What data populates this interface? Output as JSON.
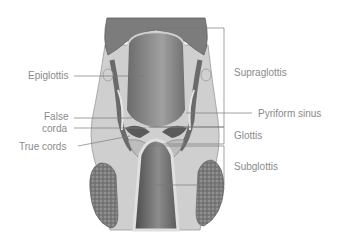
{
  "diagram": {
    "left_labels": [
      {
        "id": "epiglottis",
        "text": "Epiglottis"
      },
      {
        "id": "false-cords-line1",
        "text": "False"
      },
      {
        "id": "false-cords-line2",
        "text": "corda"
      },
      {
        "id": "true-cords",
        "text": "True cords"
      }
    ],
    "right_labels": [
      {
        "id": "supraglottis",
        "text": "Supraglottis"
      },
      {
        "id": "pyriform-sinus",
        "text": "Pyriform sinus"
      },
      {
        "id": "glottis",
        "text": "Glottis"
      },
      {
        "id": "subglottis",
        "text": "Subglottis"
      }
    ],
    "colors": {
      "label_text": "#8a8a8a",
      "leader_line": "#7a7a7a",
      "tissue_dark": "#5a5a5a",
      "tissue_mid": "#9a9a9a",
      "tissue_light": "#d8d8d8",
      "gland": "#777777"
    }
  }
}
